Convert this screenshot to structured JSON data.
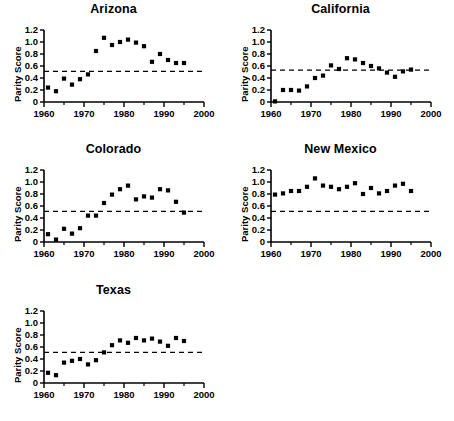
{
  "figure": {
    "background": "#ffffff",
    "marker_color": "#000000",
    "axis_color": "#000000",
    "reference_line_color": "#000000",
    "reference_line_style": "dashed"
  },
  "chart_data": {
    "type": "scatter",
    "title": "",
    "xlabel": "",
    "ylabel": "Parity Score",
    "xlim": [
      1960,
      2000
    ],
    "ylim": [
      0,
      1.2
    ],
    "xticks": [
      1960,
      1970,
      1980,
      1990,
      2000
    ],
    "xtick_labels": [
      "1960",
      "1970",
      "1980",
      "1990",
      "2000"
    ],
    "x_minor_ticks": [
      1965,
      1975,
      1985,
      1995
    ],
    "yticks": [
      0,
      0.2,
      0.4,
      0.6,
      0.8,
      1.0,
      1.2
    ],
    "ytick_labels": [
      "0",
      "0.2",
      "0.4",
      "0.6",
      "0.8",
      "1.0",
      "1.2"
    ],
    "grid": false,
    "legend": null,
    "reference_line_y": 0.51,
    "panels": [
      {
        "title": "Arizona",
        "reference_line_y": 0.51,
        "x": [
          1961,
          1963,
          1965,
          1967,
          1969,
          1971,
          1973,
          1975,
          1977,
          1979,
          1981,
          1983,
          1985,
          1987,
          1989,
          1991,
          1993,
          1995
        ],
        "y": [
          0.24,
          0.18,
          0.39,
          0.29,
          0.38,
          0.46,
          0.85,
          1.07,
          0.95,
          1.0,
          1.04,
          0.99,
          0.93,
          0.67,
          0.8,
          0.7,
          0.65,
          0.65
        ]
      },
      {
        "title": "California",
        "reference_line_y": 0.53,
        "x": [
          1961,
          1963,
          1965,
          1967,
          1969,
          1971,
          1973,
          1975,
          1977,
          1979,
          1981,
          1983,
          1985,
          1987,
          1989,
          1991,
          1993,
          1995
        ],
        "y": [
          0.01,
          0.2,
          0.2,
          0.19,
          0.26,
          0.4,
          0.44,
          0.61,
          0.55,
          0.73,
          0.71,
          0.65,
          0.6,
          0.56,
          0.49,
          0.42,
          0.51,
          0.54
        ]
      },
      {
        "title": "Colorado",
        "reference_line_y": 0.51,
        "x": [
          1961,
          1963,
          1965,
          1967,
          1969,
          1971,
          1973,
          1975,
          1977,
          1979,
          1981,
          1983,
          1985,
          1987,
          1989,
          1991,
          1993,
          1995
        ],
        "y": [
          0.13,
          0.04,
          0.22,
          0.14,
          0.23,
          0.44,
          0.44,
          0.65,
          0.79,
          0.88,
          0.94,
          0.71,
          0.76,
          0.74,
          0.88,
          0.86,
          0.67,
          0.49
        ]
      },
      {
        "title": "New Mexico",
        "reference_line_y": 0.51,
        "x": [
          1961,
          1963,
          1965,
          1967,
          1969,
          1971,
          1973,
          1975,
          1977,
          1979,
          1981,
          1983,
          1985,
          1987,
          1989,
          1991,
          1993,
          1995
        ],
        "y": [
          0.79,
          0.81,
          0.85,
          0.85,
          0.92,
          1.06,
          0.94,
          0.92,
          0.88,
          0.92,
          0.98,
          0.8,
          0.9,
          0.81,
          0.85,
          0.94,
          0.97,
          0.85
        ]
      },
      {
        "title": "Texas",
        "reference_line_y": 0.51,
        "x": [
          1961,
          1963,
          1965,
          1967,
          1969,
          1971,
          1973,
          1975,
          1977,
          1979,
          1981,
          1983,
          1985,
          1987,
          1989,
          1991,
          1993,
          1995
        ],
        "y": [
          0.17,
          0.13,
          0.34,
          0.37,
          0.4,
          0.31,
          0.38,
          0.51,
          0.63,
          0.71,
          0.67,
          0.75,
          0.71,
          0.74,
          0.69,
          0.62,
          0.75,
          0.7
        ]
      }
    ]
  }
}
